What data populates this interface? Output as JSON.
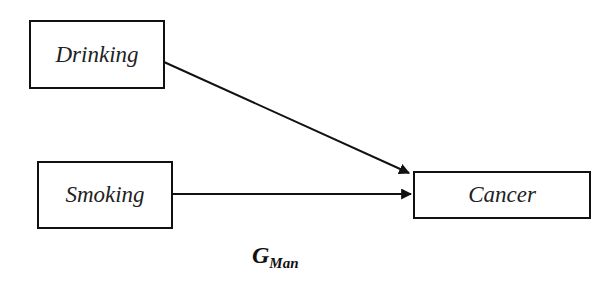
{
  "diagram": {
    "nodes": [
      {
        "id": "drinking",
        "label": "Drinking"
      },
      {
        "id": "smoking",
        "label": "Smoking"
      },
      {
        "id": "cancer",
        "label": "Cancer"
      }
    ],
    "edges": [
      {
        "from": "drinking",
        "to": "cancer"
      },
      {
        "from": "smoking",
        "to": "cancer"
      }
    ],
    "caption": {
      "main": "G",
      "subscript": "Man"
    }
  }
}
